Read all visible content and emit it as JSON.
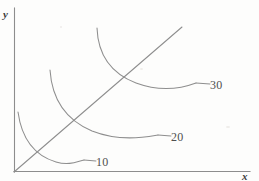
{
  "figure": {
    "kind": "line",
    "background_color": "#fdfdfc",
    "stroke_color": "#8e8e8e",
    "text_color": "#4a4a4a"
  },
  "axes": {
    "y_label": "y",
    "x_label": "x",
    "y_axis_top": 8,
    "y_axis_bottom": 172,
    "x_axis_left": 14,
    "x_axis_right": 250,
    "origin": [
      14,
      172
    ],
    "ticks": [],
    "grid": false
  },
  "chart_data": {
    "type": "line",
    "title": "",
    "subtitle": "",
    "xlabel": "x",
    "ylabel": "y",
    "xlim": [
      0,
      250
    ],
    "ylim": [
      0,
      172
    ],
    "grid": false,
    "legend": "none",
    "series": [
      {
        "name": "10",
        "label": "10",
        "label_position": [
          98,
          163
        ],
        "leader_line": [
          [
            84,
            160
          ],
          [
            96,
            161
          ]
        ],
        "path": "M 18,112 C 22,141 36,156 56,162 C 70,166 78,161 84,160",
        "points": [
          [
            18,
            112
          ],
          [
            26,
            138
          ],
          [
            38,
            153
          ],
          [
            52,
            160
          ],
          [
            66,
            163
          ],
          [
            84,
            160
          ]
        ]
      },
      {
        "name": "20",
        "label": "20",
        "label_position": [
          173,
          138
        ],
        "leader_line": [
          [
            158,
            135
          ],
          [
            171,
            136
          ]
        ],
        "path": "M 50,70 C 52,100 66,120 92,131 C 120,142 146,137 158,135",
        "points": [
          [
            50,
            70
          ],
          [
            57,
            98
          ],
          [
            70,
            117
          ],
          [
            92,
            131
          ],
          [
            120,
            138
          ],
          [
            144,
            138
          ],
          [
            158,
            135
          ]
        ]
      },
      {
        "name": "30",
        "label": "30",
        "label_position": [
          212,
          85
        ],
        "leader_line": [
          [
            196,
            83
          ],
          [
            210,
            84
          ]
        ],
        "path": "M 97,28 C 98,55 110,73 136,83 C 166,94 188,86 196,83",
        "points": [
          [
            97,
            28
          ],
          [
            101,
            52
          ],
          [
            114,
            71
          ],
          [
            136,
            83
          ],
          [
            164,
            89
          ],
          [
            186,
            86
          ],
          [
            196,
            83
          ]
        ]
      }
    ],
    "ray": {
      "name": "expansion-path",
      "label": "",
      "from": [
        14,
        172
      ],
      "to": [
        182,
        27
      ],
      "slope": 0.863
    }
  },
  "labels": {
    "curve_10": "10",
    "curve_20": "20",
    "curve_30": "30",
    "axis_y": "y",
    "axis_x": "x"
  }
}
